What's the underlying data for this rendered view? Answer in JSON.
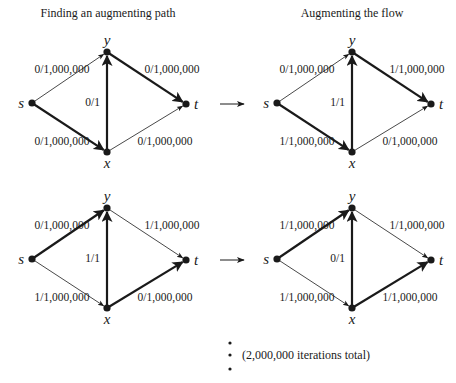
{
  "titles": {
    "left": "Finding an augmenting path",
    "right": "Augmenting the flow"
  },
  "nodes": {
    "s": "s",
    "t": "t",
    "x": "x",
    "y": "y"
  },
  "colors": {
    "ink": "#1a1a1a",
    "thin": "#555555",
    "background": "#ffffff"
  },
  "diagrams": [
    {
      "id": "top-left",
      "edges": {
        "sy": {
          "label": "0/1,000,000",
          "bold": false
        },
        "sx": {
          "label": "0/1,000,000",
          "bold": true
        },
        "xy": {
          "label": "0/1",
          "bold": true
        },
        "yt": {
          "label": "0/1,000,000",
          "bold": true
        },
        "xt": {
          "label": "0/1,000,000",
          "bold": false
        }
      }
    },
    {
      "id": "top-right",
      "edges": {
        "sy": {
          "label": "0/1,000,000",
          "bold": false
        },
        "sx": {
          "label": "1/1,000,000",
          "bold": true
        },
        "xy": {
          "label": "1/1",
          "bold": true
        },
        "yt": {
          "label": "1/1,000,000",
          "bold": true
        },
        "xt": {
          "label": "0/1,000,000",
          "bold": false
        }
      }
    },
    {
      "id": "bottom-left",
      "edges": {
        "sy": {
          "label": "0/1,000,000",
          "bold": true
        },
        "sx": {
          "label": "1/1,000,000",
          "bold": false
        },
        "xy": {
          "label": "1/1",
          "bold": true
        },
        "yt": {
          "label": "1/1,000,000",
          "bold": false
        },
        "xt": {
          "label": "0/1,000,000",
          "bold": true
        }
      }
    },
    {
      "id": "bottom-right",
      "edges": {
        "sy": {
          "label": "1/1,000,000",
          "bold": true
        },
        "sx": {
          "label": "1/1,000,000",
          "bold": false
        },
        "xy": {
          "label": "0/1",
          "bold": true
        },
        "yt": {
          "label": "1/1,000,000",
          "bold": false
        },
        "xt": {
          "label": "1/1,000,000",
          "bold": true
        }
      }
    }
  ],
  "footer": {
    "iterations_note": "(2,000,000 iterations total)"
  }
}
